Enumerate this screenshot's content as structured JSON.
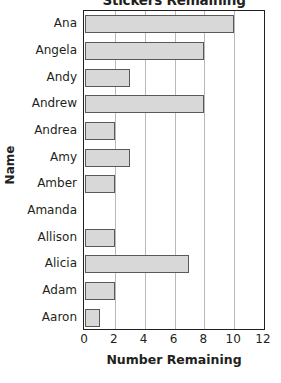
{
  "chart_data": {
    "type": "bar",
    "orientation": "horizontal",
    "title": "Stickers Remaining",
    "xlabel": "Number Remaining",
    "ylabel": "Name",
    "categories": [
      "Ana",
      "Angela",
      "Andy",
      "Andrew",
      "Andrea",
      "Amy",
      "Amber",
      "Amanda",
      "Allison",
      "Alicia",
      "Adam",
      "Aaron"
    ],
    "values": [
      10,
      8,
      3,
      8,
      2,
      3,
      2,
      0,
      2,
      7,
      2,
      1
    ],
    "xlim": [
      0,
      12
    ],
    "xticks": [
      0,
      2,
      4,
      6,
      8,
      10,
      12
    ],
    "grid": "vertical",
    "legend": "none",
    "bar_fill": "#d8d8d8",
    "bar_border": "#595959",
    "axis_color": "#231f20",
    "gridline_color": "#b9b9b9"
  }
}
